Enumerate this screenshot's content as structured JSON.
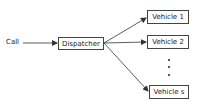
{
  "diagram": {
    "input_label": "Call",
    "dispatcher_label": "Dispatcher",
    "vehicles": [
      {
        "label": "Vehicle 1"
      },
      {
        "label": "Vehicle 2"
      },
      {
        "label": "Vehicle s"
      }
    ],
    "ellipsis": "⋮",
    "line_color": "#333333"
  }
}
